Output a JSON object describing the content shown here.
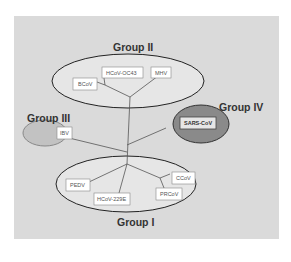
{
  "diagram": {
    "title": "",
    "groups": [
      {
        "name": "Group II",
        "members": [
          "BCoV",
          "HCoV-OC43",
          "MHV"
        ],
        "fill": "#e8e8e8",
        "stroke": "#222222"
      },
      {
        "name": "Group III",
        "members": [
          "IBV"
        ],
        "fill": "#c0c0c0",
        "stroke": "#888888"
      },
      {
        "name": "Group IV",
        "members": [
          "SARS-CoV"
        ],
        "fill": "#888888",
        "stroke": "#333333"
      },
      {
        "name": "Group I",
        "members": [
          "PEDV",
          "HCoV-229E",
          "PRCoV",
          "CCoV"
        ],
        "fill": "#e8e8e8",
        "stroke": "#222222"
      }
    ],
    "labels": {
      "group2": "Group II",
      "group3": "Group III",
      "group4": "Group IV",
      "group1": "Group I",
      "bcov": "BCoV",
      "hcov_oc43": "HCoV-OC43",
      "mhv": "MHV",
      "ibv": "IBV",
      "sars_cov": "SARS-CoV",
      "pedv": "PEDV",
      "hcov_229e": "HCoV-229E",
      "prcov": "PRCoV",
      "ccov": "CCoV"
    },
    "colors": {
      "background": "#dadada",
      "line": "#555555"
    }
  }
}
